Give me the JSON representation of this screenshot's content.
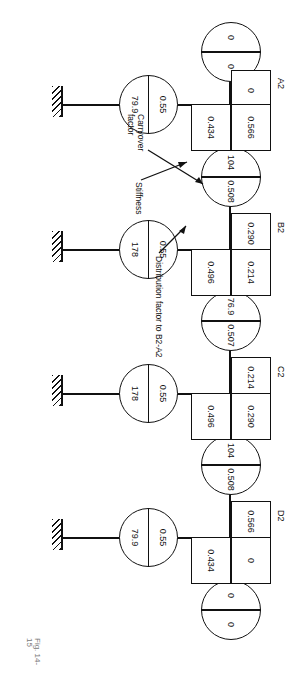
{
  "figure": {
    "caption": "Fig. 14-15",
    "annotations": [
      {
        "name": "distribution-factor-note",
        "text": "Distribution factor to B2-A2"
      },
      {
        "name": "stiffness-note",
        "text": "Stiffness"
      },
      {
        "name": "carryover-factor-note",
        "text": "Carryover factor"
      }
    ]
  },
  "joints": [
    {
      "id": "A2",
      "label": "A2",
      "box_far": "0",
      "box_near": "0.566",
      "box_beam": "0.434"
    },
    {
      "id": "B2",
      "label": "B2",
      "box_far": "0.290",
      "box_near": "0.214",
      "box_beam": "0.496"
    },
    {
      "id": "C2",
      "label": "C2",
      "box_far": "0.214",
      "box_near": "0.290",
      "box_beam": "0.496"
    },
    {
      "id": "D2",
      "label": "D2",
      "box_far": "0.566",
      "box_near": "0",
      "box_beam": "0.434"
    }
  ],
  "column_circles": [
    {
      "name": "circle-below-A2",
      "stiffness": "0",
      "carryover": "0"
    },
    {
      "name": "circle-A2-B2",
      "stiffness": "104",
      "carryover": "0.508"
    },
    {
      "name": "circle-B2-C2",
      "stiffness": "76.9",
      "carryover": "0.507"
    },
    {
      "name": "circle-C2-D2",
      "stiffness": "104",
      "carryover": "0.508"
    },
    {
      "name": "circle-above-D2",
      "stiffness": "0",
      "carryover": "0"
    }
  ],
  "beam_circles": [
    {
      "name": "beam-circle-A2",
      "carryover": "0.55",
      "stiffness": "79.9"
    },
    {
      "name": "beam-circle-B2",
      "carryover": "0.55",
      "stiffness": "178"
    },
    {
      "name": "beam-circle-C2",
      "carryover": "0.55",
      "stiffness": "178"
    },
    {
      "name": "beam-circle-D2",
      "carryover": "0.55",
      "stiffness": "79.9"
    }
  ]
}
